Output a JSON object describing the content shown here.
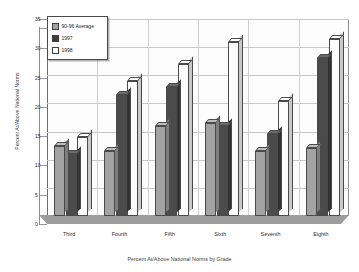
{
  "chart_data": {
    "type": "bar",
    "title": "",
    "xlabel": "Percent At/Above National Norms by Grade",
    "ylabel": "Percent At/Above National Norms",
    "categories": [
      "Third",
      "Fourth",
      "Fifth",
      "Sixth",
      "Seventh",
      "Eighth"
    ],
    "series": [
      {
        "name": "90-96 Average",
        "color": "#a3a3a3",
        "values": [
          12.5,
          11.5,
          16,
          16.5,
          11.5,
          12
        ]
      },
      {
        "name": "1997",
        "color": "#3d3d3d",
        "values": [
          11,
          21.5,
          23,
          16,
          14.5,
          28
        ]
      },
      {
        "name": "1998",
        "color": "#ffffff",
        "values": [
          14,
          24,
          27,
          31,
          20.5,
          31.5
        ]
      }
    ],
    "ylim": [
      0,
      35
    ],
    "yticks": [
      0,
      5,
      10,
      15,
      20,
      25,
      30,
      35
    ],
    "ytick_labels": [
      "0",
      "5",
      "10",
      "15",
      "20",
      "25",
      "30",
      "35"
    ],
    "grid": true,
    "legend_position": "upper-left",
    "style": "3d-clustered-column"
  },
  "legend": {
    "entries": [
      {
        "label": "90-96 Average"
      },
      {
        "label": "1997"
      },
      {
        "label": "1998"
      }
    ]
  },
  "top_strip": {
    "text": ""
  }
}
